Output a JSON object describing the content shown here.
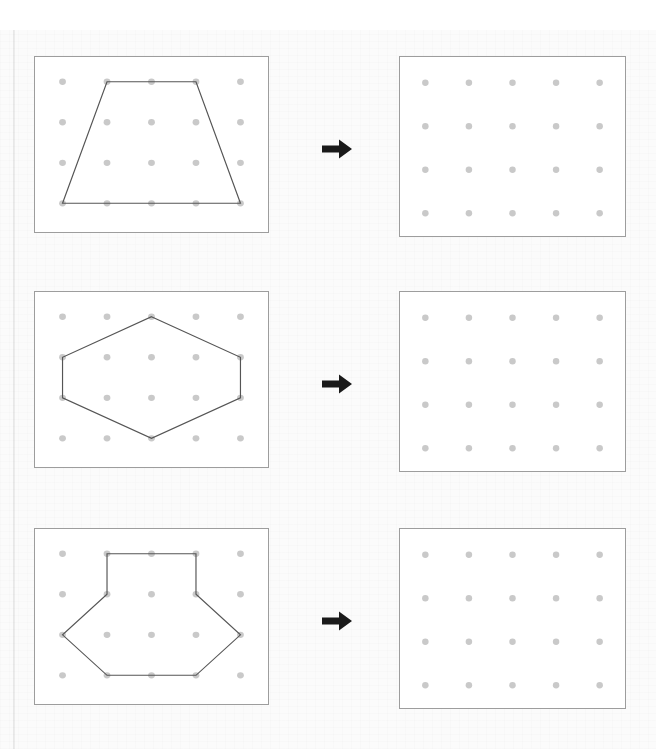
{
  "page": {
    "clipped_heading_text": "",
    "background_color": "#fbfbfb",
    "panel_background_color": "#ffffff",
    "panel_border_color": "#9d9d9d",
    "dot_color": "#c9c9c9",
    "shape_stroke_color": "#555555",
    "arrow_color": "#1a1a1a"
  },
  "grid": {
    "columns": 5,
    "rows": 4,
    "dot_radius": 3.2,
    "col_x": [
      26,
      68,
      110,
      152,
      194
    ],
    "row_y": [
      25,
      66,
      107,
      148
    ]
  },
  "grid_right": {
    "columns": 5,
    "rows": 4,
    "dot_radius": 3.2,
    "col_x": [
      25,
      68,
      111,
      154,
      197
    ],
    "row_y": [
      26,
      70,
      114,
      158
    ]
  },
  "rows": [
    {
      "index": 1,
      "name": "trapezoid-task",
      "top": 56,
      "arrow_top": 138,
      "arrow_icon": "arrow-right-icon",
      "source": {
        "name": "trapezoid",
        "shape_label": "Trapezoid",
        "vertex_count": 4,
        "vertices_grid": [
          [
            2,
            1
          ],
          [
            4,
            1
          ],
          [
            5,
            4
          ],
          [
            1,
            4
          ]
        ],
        "points": "68,25 152,25 194,148 26,148"
      },
      "target": {
        "name": "empty-geoboard",
        "shape_label": "Empty grid",
        "points": ""
      }
    },
    {
      "index": 2,
      "name": "hexagon-task",
      "top": 291,
      "arrow_top": 373,
      "arrow_icon": "arrow-right-icon",
      "source": {
        "name": "hexagon",
        "shape_label": "Hexagon",
        "vertex_count": 6,
        "vertices_grid": [
          [
            3,
            1
          ],
          [
            5,
            2
          ],
          [
            5,
            3
          ],
          [
            3,
            4
          ],
          [
            1,
            3
          ],
          [
            1,
            2
          ]
        ],
        "points": "110,25 194,66 194,107 110,148 26,107 26,66"
      },
      "target": {
        "name": "empty-geoboard",
        "shape_label": "Empty grid",
        "points": ""
      }
    },
    {
      "index": 3,
      "name": "house-arrow-task",
      "top": 528,
      "arrow_top": 610,
      "arrow_icon": "arrow-right-icon",
      "source": {
        "name": "house-arrow-polygon",
        "shape_label": "Octagon (house-arrow)",
        "vertex_count": 8,
        "vertices_grid": [
          [
            2,
            1
          ],
          [
            4,
            1
          ],
          [
            4,
            2
          ],
          [
            5,
            3
          ],
          [
            4,
            4
          ],
          [
            2,
            4
          ],
          [
            1,
            3
          ],
          [
            2,
            2
          ]
        ],
        "points": "68,25 152,25 152,66 194,107 152,148 68,148 26,107 68,66"
      },
      "target": {
        "name": "empty-geoboard",
        "shape_label": "Empty grid",
        "points": ""
      }
    }
  ]
}
